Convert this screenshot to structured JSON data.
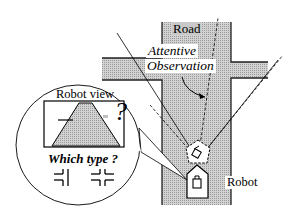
{
  "diagram": {
    "labels": {
      "road": "Road",
      "attentive": "Attentive",
      "observation": "Observation",
      "robot": "Robot",
      "robot_view": "Robot view",
      "question_mark": "?",
      "which_type": "Which type ?"
    },
    "junction_types": [
      {
        "name": "T-junction",
        "glyph": "=|  (branch on left only)"
      },
      {
        "name": "crossroad",
        "glyph": "=|= (branches both sides)"
      }
    ],
    "colors": {
      "road_fill": "#c4c4c4",
      "road_outline": "#222222",
      "line": "#000000",
      "background": "#ffffff"
    }
  }
}
